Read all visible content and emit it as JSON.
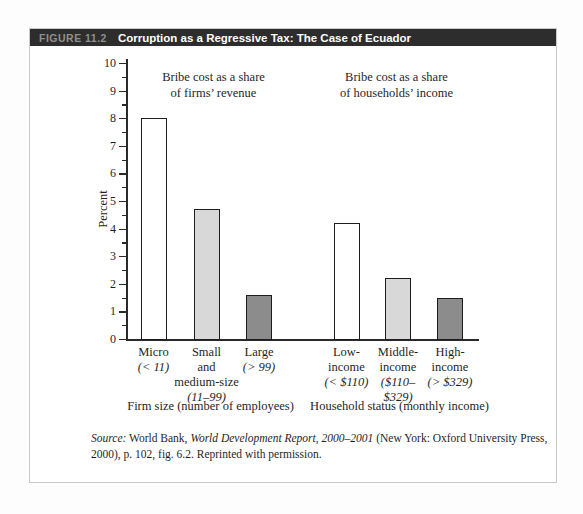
{
  "header": {
    "figure_label": "FIGURE 11.2",
    "title": "Corruption as a Regressive Tax: The Case of Ecuador"
  },
  "colors": {
    "header_bg": "#2d2d2d",
    "figure_label_color": "#8f8f8f",
    "title_color": "#ffffff",
    "box_border": "#c9c9c9",
    "axis_color": "#2a2a2a",
    "text_color": "#1f1f1f",
    "bar_white": "#ffffff",
    "bar_light_gray": "#d8d8d8",
    "bar_dark_gray": "#8c8c8c",
    "bar_border": "#1d1d1d"
  },
  "chart_data": {
    "type": "bar",
    "title": "",
    "xlabel": "",
    "ylabel": "Percent",
    "ylim": [
      0,
      10
    ],
    "ytick_interval": 1,
    "minor_tick_interval": 0.5,
    "grid": false,
    "legend": "none",
    "groups": [
      {
        "annotation_lines": [
          "Bribe cost as a share",
          "of firms’ revenue"
        ],
        "caption": "Firm size (number of employees)",
        "bars": [
          {
            "label_lines": [
              "Micro"
            ],
            "sub_lines": [
              "(< 11)"
            ],
            "value": 8.0,
            "fill": "white"
          },
          {
            "label_lines": [
              "Small",
              "and",
              "medium-size"
            ],
            "sub_lines": [
              "(11–99)"
            ],
            "value": 4.7,
            "fill": "light"
          },
          {
            "label_lines": [
              "Large"
            ],
            "sub_lines": [
              "(> 99)"
            ],
            "value": 1.6,
            "fill": "dark"
          }
        ]
      },
      {
        "annotation_lines": [
          "Bribe cost as a share",
          "of households’ income"
        ],
        "caption": "Household status (monthly income)",
        "bars": [
          {
            "label_lines": [
              "Low-",
              "income"
            ],
            "sub_lines": [
              "(< $110)"
            ],
            "value": 4.2,
            "fill": "white"
          },
          {
            "label_lines": [
              "Middle-",
              "income"
            ],
            "sub_lines": [
              "($110–",
              "$329)"
            ],
            "value": 2.2,
            "fill": "light"
          },
          {
            "label_lines": [
              "High-",
              "income"
            ],
            "sub_lines": [
              "(> $329)"
            ],
            "value": 1.5,
            "fill": "dark"
          }
        ]
      }
    ]
  },
  "source_note": {
    "segments": [
      {
        "text": "Source:",
        "italic": true
      },
      {
        "text": " World Bank, ",
        "italic": false
      },
      {
        "text": "World Development Report, 2000–2001",
        "italic": true
      },
      {
        "text": " (New York: Oxford University Press, 2000), p. 102, fig. 6.2. Reprinted with permission.",
        "italic": false
      }
    ]
  }
}
